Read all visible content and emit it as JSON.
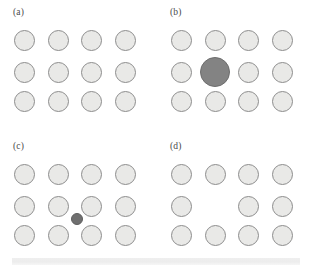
{
  "figure": {
    "width": 314,
    "height": 268,
    "background": "#ffffff",
    "colors": {
      "host_atom_fill": "#e9e9e7",
      "host_atom_stroke": "#8d8d8d",
      "substitutional_atom_fill": "#838383",
      "interstitial_atom_fill": "#6f6f6f",
      "label_color": "#4a4a4a",
      "footer_band": "#efefef"
    },
    "lattice": {
      "columns": 4,
      "rows": 3,
      "column_centers": [
        24,
        58,
        91,
        125
      ],
      "row_centers": [
        40,
        72,
        101
      ],
      "host_diameter": 21
    }
  },
  "panels": [
    {
      "id": "a",
      "label": "(a)",
      "name": "perfect-lattice",
      "atoms": [
        {
          "col": 0,
          "row": 0,
          "kind": "host",
          "d": 21
        },
        {
          "col": 1,
          "row": 0,
          "kind": "host",
          "d": 21
        },
        {
          "col": 2,
          "row": 0,
          "kind": "host",
          "d": 21
        },
        {
          "col": 3,
          "row": 0,
          "kind": "host",
          "d": 21
        },
        {
          "col": 0,
          "row": 1,
          "kind": "host",
          "d": 21
        },
        {
          "col": 1,
          "row": 1,
          "kind": "host",
          "d": 21
        },
        {
          "col": 2,
          "row": 1,
          "kind": "host",
          "d": 21
        },
        {
          "col": 3,
          "row": 1,
          "kind": "host",
          "d": 21
        },
        {
          "col": 0,
          "row": 2,
          "kind": "host",
          "d": 21
        },
        {
          "col": 1,
          "row": 2,
          "kind": "host",
          "d": 21
        },
        {
          "col": 2,
          "row": 2,
          "kind": "host",
          "d": 21
        },
        {
          "col": 3,
          "row": 2,
          "kind": "host",
          "d": 21
        }
      ]
    },
    {
      "id": "b",
      "label": "(b)",
      "name": "substitutional-defect",
      "atoms": [
        {
          "col": 0,
          "row": 0,
          "kind": "host",
          "d": 21
        },
        {
          "col": 1,
          "row": 0,
          "kind": "host",
          "d": 21
        },
        {
          "col": 2,
          "row": 0,
          "kind": "host",
          "d": 21
        },
        {
          "col": 3,
          "row": 0,
          "kind": "host",
          "d": 21
        },
        {
          "col": 0,
          "row": 1,
          "kind": "host",
          "d": 21
        },
        {
          "col": 1,
          "row": 1,
          "kind": "substitutional",
          "d": 30
        },
        {
          "col": 2,
          "row": 1,
          "kind": "host",
          "d": 21
        },
        {
          "col": 3,
          "row": 1,
          "kind": "host",
          "d": 21
        },
        {
          "col": 0,
          "row": 2,
          "kind": "host",
          "d": 21
        },
        {
          "col": 1,
          "row": 2,
          "kind": "host",
          "d": 21
        },
        {
          "col": 2,
          "row": 2,
          "kind": "host",
          "d": 21
        },
        {
          "col": 3,
          "row": 2,
          "kind": "host",
          "d": 21
        }
      ]
    },
    {
      "id": "c",
      "label": "(c)",
      "name": "interstitial-defect",
      "atoms": [
        {
          "col": 0,
          "row": 0,
          "kind": "host",
          "d": 21
        },
        {
          "col": 1,
          "row": 0,
          "kind": "host",
          "d": 21
        },
        {
          "col": 2,
          "row": 0,
          "kind": "host",
          "d": 21
        },
        {
          "col": 3,
          "row": 0,
          "kind": "host",
          "d": 21
        },
        {
          "col": 0,
          "row": 1,
          "kind": "host",
          "d": 21
        },
        {
          "col": 1,
          "row": 1,
          "kind": "host",
          "d": 21
        },
        {
          "col": 2,
          "row": 1,
          "kind": "host",
          "d": 21
        },
        {
          "col": 3,
          "row": 1,
          "kind": "host",
          "d": 21
        },
        {
          "col": 0,
          "row": 2,
          "kind": "host",
          "d": 21
        },
        {
          "col": 1,
          "row": 2,
          "kind": "host",
          "d": 21
        },
        {
          "col": 2,
          "row": 2,
          "kind": "host",
          "d": 21
        },
        {
          "col": 3,
          "row": 2,
          "kind": "host",
          "d": 21
        },
        {
          "x": 77,
          "y": 85,
          "kind": "interstitial",
          "d": 12
        }
      ]
    },
    {
      "id": "d",
      "label": "(d)",
      "name": "vacancy-defect",
      "atoms": [
        {
          "col": 0,
          "row": 0,
          "kind": "host",
          "d": 21
        },
        {
          "col": 1,
          "row": 0,
          "kind": "host",
          "d": 21
        },
        {
          "col": 2,
          "row": 0,
          "kind": "host",
          "d": 21
        },
        {
          "col": 3,
          "row": 0,
          "kind": "host",
          "d": 21
        },
        {
          "col": 0,
          "row": 1,
          "kind": "host",
          "d": 21
        },
        {
          "col": 2,
          "row": 1,
          "kind": "host",
          "d": 21
        },
        {
          "col": 3,
          "row": 1,
          "kind": "host",
          "d": 21
        },
        {
          "col": 0,
          "row": 2,
          "kind": "host",
          "d": 21
        },
        {
          "col": 1,
          "row": 2,
          "kind": "host",
          "d": 21
        },
        {
          "col": 2,
          "row": 2,
          "kind": "host",
          "d": 21
        },
        {
          "col": 3,
          "row": 2,
          "kind": "host",
          "d": 21
        }
      ]
    }
  ],
  "footer": {
    "band_label": "footer-band",
    "left": 12,
    "top": 258,
    "width": 288,
    "height": 7
  }
}
